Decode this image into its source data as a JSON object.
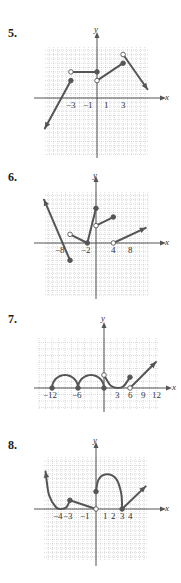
{
  "colors": {
    "curve": "#555555",
    "axis": "#555555",
    "grid": "#b8b8b8",
    "open_fill": "#ffffff"
  },
  "problems": [
    {
      "number": "5.",
      "axis_x_label": "x",
      "axis_y_label": "y",
      "tick_labels": [
        "−3",
        "−1",
        "1",
        "3"
      ]
    },
    {
      "number": "6.",
      "axis_x_label": "x",
      "axis_y_label": "y",
      "tick_labels": [
        "−8",
        "−2",
        "4",
        "8"
      ]
    },
    {
      "number": "7.",
      "axis_x_label": "x",
      "axis_y_label": "y",
      "tick_labels": [
        "−12",
        "−6",
        "3",
        "6",
        "9",
        "12"
      ]
    },
    {
      "number": "8.",
      "axis_x_label": "x",
      "axis_y_label": "y",
      "tick_labels": [
        "−4",
        "−3",
        "−1",
        "1",
        "2",
        "3",
        "4"
      ]
    }
  ],
  "chart_data": [
    {
      "type": "line",
      "title": "5.",
      "xlabel": "x",
      "ylabel": "y",
      "grid": true,
      "x_ticks": [
        -3,
        -1,
        1,
        3
      ],
      "xlim": [
        -6,
        6
      ],
      "ylim": [
        -6,
        6
      ],
      "unit": 1,
      "segments": [
        {
          "kind": "line",
          "from": [
            -6,
            -3.5
          ],
          "to": [
            -3,
            2
          ],
          "start": "arrow",
          "end": "closed"
        },
        {
          "kind": "line",
          "from": [
            -3,
            3
          ],
          "to": [
            0,
            3
          ],
          "start": "open",
          "end": "closed"
        },
        {
          "kind": "line",
          "from": [
            0,
            2
          ],
          "to": [
            3,
            4
          ],
          "start": "open",
          "end": "closed"
        },
        {
          "kind": "line",
          "from": [
            3,
            5
          ],
          "to": [
            5.8,
            1
          ],
          "start": "open",
          "end": "arrow"
        }
      ]
    },
    {
      "type": "line",
      "title": "6.",
      "xlabel": "x",
      "ylabel": "y",
      "grid": true,
      "x_ticks": [
        -8,
        -2,
        4,
        8
      ],
      "xlim": [
        -12,
        12
      ],
      "ylim": [
        -12,
        12
      ],
      "unit": 2,
      "segments": [
        {
          "kind": "line",
          "from": [
            -12,
            10
          ],
          "to": [
            -6,
            -4
          ],
          "start": "arrow",
          "end": "closed"
        },
        {
          "kind": "line",
          "from": [
            -6,
            2
          ],
          "to": [
            -2,
            0
          ],
          "start": "open",
          "end": "closed"
        },
        {
          "kind": "line",
          "from": [
            -2,
            0
          ],
          "to": [
            0,
            8
          ],
          "start": "none",
          "end": "closed"
        },
        {
          "kind": "line",
          "from": [
            0,
            4
          ],
          "to": [
            4,
            6
          ],
          "start": "open",
          "end": "closed"
        },
        {
          "kind": "line",
          "from": [
            4,
            0
          ],
          "to": [
            11.5,
            3.5
          ],
          "start": "open",
          "end": "arrow"
        }
      ]
    },
    {
      "type": "line",
      "title": "7.",
      "xlabel": "x",
      "ylabel": "y",
      "grid": true,
      "x_ticks": [
        -12,
        -6,
        3,
        6,
        9,
        12
      ],
      "xlim": [
        -15,
        15
      ],
      "ylim": [
        -6,
        18
      ],
      "unit": 3,
      "segments": [
        {
          "kind": "semicircle",
          "from": [
            -12,
            0
          ],
          "to": [
            -6,
            0
          ],
          "peak": 3,
          "start": "closed",
          "end": "closed"
        },
        {
          "kind": "semicircle",
          "from": [
            -6,
            0
          ],
          "to": [
            0,
            0
          ],
          "peak": 3,
          "start": "none",
          "end": "closed"
        },
        {
          "kind": "curve",
          "points": [
            [
              0,
              3
            ],
            [
              1.5,
              0.6
            ],
            [
              3,
              0
            ],
            [
              4.5,
              0.4
            ],
            [
              6,
              2.5
            ]
          ],
          "start": "open",
          "end": "closed"
        },
        {
          "kind": "line",
          "from": [
            6,
            0
          ],
          "to": [
            12,
            6
          ],
          "start": "open",
          "end": "arrow"
        }
      ]
    },
    {
      "type": "line",
      "title": "8.",
      "xlabel": "x",
      "ylabel": "y",
      "grid": true,
      "x_ticks": [
        -4,
        -3,
        -1,
        1,
        2,
        3,
        4
      ],
      "xlim": [
        -6,
        6
      ],
      "ylim": [
        -6,
        6
      ],
      "unit": 1,
      "segments": [
        {
          "kind": "curve",
          "points": [
            [
              -5.8,
              4.3
            ],
            [
              -5.4,
              1.6
            ],
            [
              -4.6,
              0.2
            ],
            [
              -4,
              0
            ],
            [
              -3.4,
              0.2
            ],
            [
              -3,
              1
            ]
          ],
          "start": "arrow",
          "end": "closed"
        },
        {
          "kind": "line",
          "from": [
            -3,
            1
          ],
          "to": [
            0,
            0
          ],
          "start": "none",
          "end": "open"
        },
        {
          "kind": "curve",
          "points": [
            [
              0,
              2
            ],
            [
              0.3,
              3.4
            ],
            [
              1.2,
              4
            ],
            [
              2.3,
              3.5
            ],
            [
              2.9,
              1.8
            ],
            [
              3,
              0
            ]
          ],
          "start": "closed",
          "end": "closed"
        },
        {
          "kind": "line",
          "from": [
            3,
            0
          ],
          "to": [
            5.7,
            2.6
          ],
          "start": "none",
          "end": "arrow"
        }
      ]
    }
  ]
}
